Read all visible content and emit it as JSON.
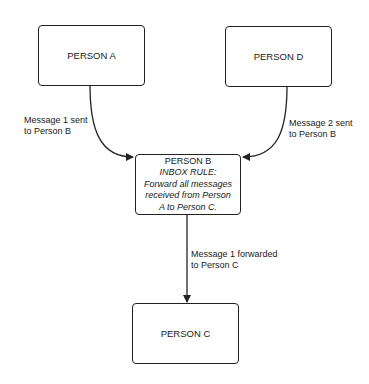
{
  "nodes": {
    "person_a": {
      "label": "PERSON A"
    },
    "person_d": {
      "label": "PERSON D"
    },
    "person_b": {
      "title": "PERSON B",
      "rule_heading": "INBOX RULE:",
      "rule_lines": [
        "Forward all messages",
        "received from Person",
        "A to Person C."
      ]
    },
    "person_c": {
      "label": "PERSON C"
    }
  },
  "edges": {
    "a_to_b": {
      "line1": "Message 1 sent",
      "line2": "to Person B"
    },
    "d_to_b": {
      "line1": "Message 2 sent",
      "line2": "to Person B"
    },
    "b_to_c": {
      "line1": "Message 1 forwarded",
      "line2": "to Person C"
    }
  }
}
